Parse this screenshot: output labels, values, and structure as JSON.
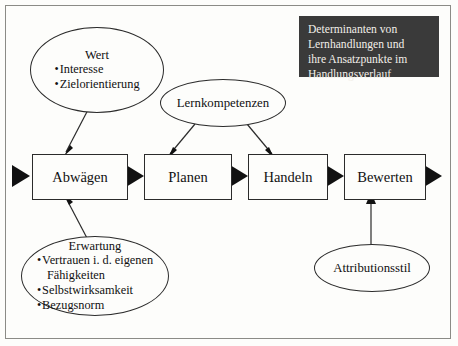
{
  "title_box": {
    "lines": [
      "Determinanten von",
      "Lernhandlungen und",
      "ihre Ansatzpunkte im",
      "Handlungsverlauf"
    ],
    "background_color": "#3a3a3a",
    "text_color": "#f2efe9"
  },
  "process_boxes": [
    {
      "label": "Abwägen"
    },
    {
      "label": "Planen"
    },
    {
      "label": "Handeln"
    },
    {
      "label": "Bewerten"
    }
  ],
  "ellipses": {
    "wert": {
      "title": "Wert",
      "items": [
        "Interesse",
        "Zielorientierung"
      ]
    },
    "lernkompetenzen": {
      "title": "Lernkompetenzen"
    },
    "erwartung": {
      "title": "Erwartung",
      "items": [
        "Vertrauen i. d. eigenen",
        "Fähigkeiten",
        "Selbstwirksamkeit",
        "Bezugsnorm"
      ]
    },
    "attributionsstil": {
      "title": "Attributionsstil"
    }
  },
  "colors": {
    "line": "#2b2b2b",
    "frame": "#8b8b86",
    "page": "#fdfdfb"
  }
}
